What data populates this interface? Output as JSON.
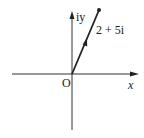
{
  "diagram": {
    "axes": {
      "x_label": "x",
      "y_label": "iy",
      "origin_label": "O"
    },
    "vector": {
      "label": "2 + 5i",
      "real": 2,
      "imag": 5
    },
    "colors": {
      "line": "#222222",
      "background": "#ffffff"
    }
  }
}
